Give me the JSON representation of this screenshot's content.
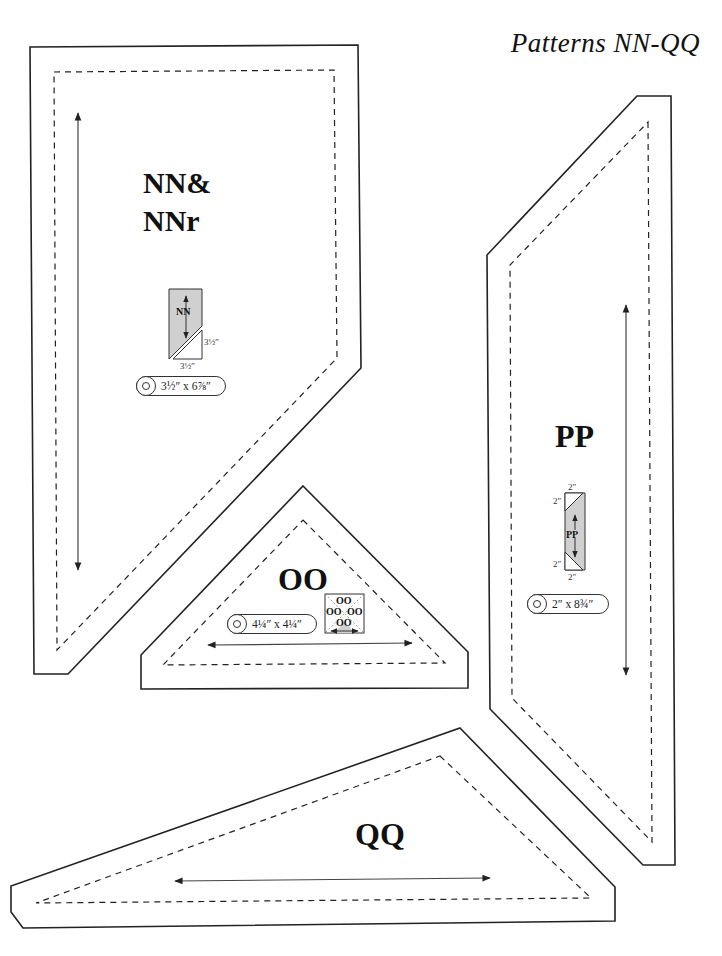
{
  "page": {
    "title": "Patterns NN-QQ",
    "colors": {
      "line": "#222222",
      "fill_gray": "#d0d0d0",
      "background": "#ffffff"
    }
  },
  "patterns": {
    "nn": {
      "label_line1": "NN&",
      "label_line2": "NNr",
      "diagram_label": "NN",
      "dim_side": "3½″",
      "dim_bottom": "3½″",
      "strip": "3½″ x 6⅞″"
    },
    "oo": {
      "label": "OO",
      "strip": "4¼″ x 4¼″",
      "diagram_labels": [
        "OO",
        "OO",
        "OO",
        "OO"
      ]
    },
    "pp": {
      "label": "PP",
      "diagram_label": "PP",
      "dim_top": "2″",
      "dim_top_side": "2″",
      "dim_bottom_side": "2″",
      "dim_bottom": "2″",
      "strip": "2″ x 8¾″"
    },
    "qq": {
      "label": "QQ"
    }
  }
}
